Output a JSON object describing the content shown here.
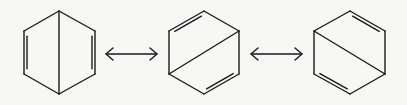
{
  "diagram": {
    "type": "resonance-structures",
    "colors": {
      "background": "#f7f7f5",
      "ink": "#1a1a1a"
    },
    "structures": [
      {
        "id": "structure-1",
        "center": [
          59,
          52
        ],
        "vertices": {
          "top": [
            59,
            11
          ],
          "upper_right": [
            95,
            31
          ],
          "lower_right": [
            95,
            74
          ],
          "bottom": [
            59,
            94
          ],
          "lower_left": [
            24,
            74
          ],
          "upper_left": [
            24,
            31
          ]
        },
        "transannular_bond": [
          "top",
          "bottom"
        ],
        "double_bonds": [
          {
            "edge": [
              "upper_left",
              "lower_left"
            ],
            "inner_offset": [
              3,
              0
            ]
          },
          {
            "edge": [
              "upper_right",
              "lower_right"
            ],
            "inner_offset": [
              -3,
              0
            ]
          }
        ]
      },
      {
        "id": "structure-2",
        "center": [
          204,
          52
        ],
        "vertices": {
          "top": [
            204,
            11
          ],
          "upper_right": [
            239,
            31
          ],
          "lower_right": [
            239,
            74
          ],
          "bottom": [
            204,
            94
          ],
          "lower_left": [
            169,
            74
          ],
          "upper_left": [
            169,
            31
          ]
        },
        "transannular_bond": [
          "lower_left",
          "upper_right"
        ],
        "double_bonds": [
          {
            "edge": [
              "upper_left",
              "top"
            ],
            "inner_offset": [
              1.6,
              2.8
            ]
          },
          {
            "edge": [
              "lower_right",
              "bottom"
            ],
            "inner_offset": [
              -1.6,
              -2.8
            ]
          }
        ]
      },
      {
        "id": "structure-3",
        "center": [
          350,
          52
        ],
        "vertices": {
          "top": [
            350,
            11
          ],
          "upper_right": [
            385,
            31
          ],
          "lower_right": [
            385,
            74
          ],
          "bottom": [
            350,
            94
          ],
          "lower_left": [
            314,
            74
          ],
          "upper_left": [
            314,
            31
          ]
        },
        "transannular_bond": [
          "upper_left",
          "lower_right"
        ],
        "double_bonds": [
          {
            "edge": [
              "top",
              "upper_right"
            ],
            "inner_offset": [
              -1.6,
              2.8
            ]
          },
          {
            "edge": [
              "lower_left",
              "bottom"
            ],
            "inner_offset": [
              1.6,
              -2.8
            ]
          }
        ]
      }
    ],
    "arrows": [
      {
        "id": "resonance-arrow-1",
        "type": "double-headed",
        "from": [
          106,
          54
        ],
        "to": [
          157,
          54
        ]
      },
      {
        "id": "resonance-arrow-2",
        "type": "double-headed",
        "from": [
          251,
          54
        ],
        "to": [
          302,
          54
        ]
      }
    ]
  }
}
